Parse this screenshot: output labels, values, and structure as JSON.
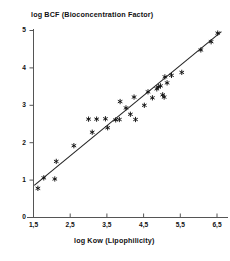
{
  "chart_data": {
    "type": "scatter",
    "title": "log BCF  (Bioconcentration Factor)",
    "xlabel": "log Kow  (Lipophilicity)",
    "ylabel": "log BCF  (Bioconcentration Factor)",
    "xlim": [
      1.5,
      6.8
    ],
    "ylim": [
      0,
      5
    ],
    "grid": false,
    "legend": null,
    "marker": "asterisk",
    "marker_color": "#111111",
    "line_color": "#222222",
    "x_tick_labels": [
      "1,5",
      "2,5",
      "3,5",
      "4,5",
      "5,5",
      "6,5"
    ],
    "x_tick_values": [
      1.5,
      2.5,
      3.5,
      4.5,
      5.5,
      6.5
    ],
    "y_tick_labels": [
      "0",
      "1",
      "2",
      "3",
      "4",
      "5"
    ],
    "y_tick_values": [
      0,
      1,
      2,
      3,
      4,
      5
    ],
    "decimal_separator": "comma",
    "regression_line": {
      "x_start": 1.52,
      "y_start": 0.86,
      "x_end": 6.62,
      "y_end": 4.97
    },
    "points": [
      {
        "x": 1.62,
        "y": 0.78
      },
      {
        "x": 1.78,
        "y": 1.06
      },
      {
        "x": 2.08,
        "y": 1.03
      },
      {
        "x": 2.12,
        "y": 1.5
      },
      {
        "x": 2.6,
        "y": 1.92
      },
      {
        "x": 3.0,
        "y": 2.63
      },
      {
        "x": 3.1,
        "y": 2.28
      },
      {
        "x": 3.22,
        "y": 2.63
      },
      {
        "x": 3.46,
        "y": 2.64
      },
      {
        "x": 3.52,
        "y": 2.4
      },
      {
        "x": 3.74,
        "y": 2.61
      },
      {
        "x": 3.84,
        "y": 2.62
      },
      {
        "x": 3.86,
        "y": 3.1
      },
      {
        "x": 4.02,
        "y": 2.93
      },
      {
        "x": 4.14,
        "y": 2.76
      },
      {
        "x": 4.24,
        "y": 3.22
      },
      {
        "x": 4.28,
        "y": 2.62
      },
      {
        "x": 4.52,
        "y": 3.0
      },
      {
        "x": 4.62,
        "y": 3.36
      },
      {
        "x": 4.74,
        "y": 3.2
      },
      {
        "x": 4.86,
        "y": 3.44
      },
      {
        "x": 4.9,
        "y": 3.49
      },
      {
        "x": 4.96,
        "y": 3.52
      },
      {
        "x": 5.02,
        "y": 3.28
      },
      {
        "x": 5.06,
        "y": 3.22
      },
      {
        "x": 5.08,
        "y": 3.76
      },
      {
        "x": 5.14,
        "y": 3.6
      },
      {
        "x": 5.26,
        "y": 3.8
      },
      {
        "x": 5.54,
        "y": 3.88
      },
      {
        "x": 6.06,
        "y": 4.48
      },
      {
        "x": 6.34,
        "y": 4.7
      },
      {
        "x": 6.52,
        "y": 4.93
      }
    ]
  }
}
